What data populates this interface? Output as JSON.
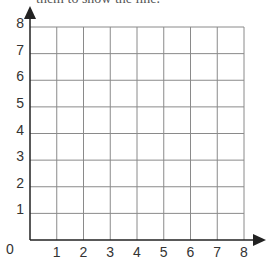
{
  "caption": "them to show the line.",
  "grid": {
    "x_min": 0,
    "x_max": 8,
    "y_min": 0,
    "y_max": 8,
    "x_ticks": [
      "1",
      "2",
      "3",
      "4",
      "5",
      "6",
      "7",
      "8"
    ],
    "y_ticks": [
      "1",
      "2",
      "3",
      "4",
      "5",
      "6",
      "7",
      "8"
    ],
    "origin_label": "0",
    "gridline_color": "#8a8a8a",
    "axis_color": "#222222"
  }
}
